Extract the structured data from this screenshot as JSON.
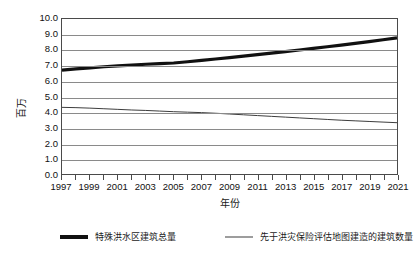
{
  "chart_data": {
    "type": "line",
    "title": "",
    "xlabel": "年份",
    "ylabel": "百万",
    "xlim": [
      1997,
      2021
    ],
    "ylim": [
      0.0,
      10.0
    ],
    "grid": true,
    "legend_position": "bottom",
    "x": [
      1997,
      1998,
      1999,
      2000,
      2001,
      2002,
      2003,
      2004,
      2005,
      2006,
      2007,
      2008,
      2009,
      2010,
      2011,
      2012,
      2013,
      2014,
      2015,
      2016,
      2017,
      2018,
      2019,
      2020,
      2021
    ],
    "x_tick_labels": [
      "1997",
      "1999",
      "2001",
      "2003",
      "2005",
      "2007",
      "2009",
      "2011",
      "2013",
      "2015",
      "2017",
      "2019",
      "2021"
    ],
    "y_tick_labels": [
      "10.0",
      "9.0",
      "8.0",
      "7.0",
      "6.0",
      "5.0",
      "4.0",
      "3.0",
      "2.0",
      "1.0",
      "0.0"
    ],
    "y_ticks": [
      10.0,
      9.0,
      8.0,
      7.0,
      6.0,
      5.0,
      4.0,
      3.0,
      2.0,
      1.0,
      0.0
    ],
    "series": [
      {
        "name": "特殊洪水区建筑总量",
        "style": "thick",
        "color": "#111111",
        "values": [
          6.7,
          6.78,
          6.85,
          6.92,
          6.98,
          7.03,
          7.08,
          7.12,
          7.16,
          7.24,
          7.33,
          7.42,
          7.51,
          7.6,
          7.7,
          7.8,
          7.9,
          8.0,
          8.1,
          8.21,
          8.32,
          8.43,
          8.54,
          8.66,
          8.78
        ]
      },
      {
        "name": "先于洪灾保险评估地图建造的建筑数量",
        "style": "thin",
        "color": "#3d3d3d",
        "values": [
          4.3,
          4.28,
          4.25,
          4.21,
          4.17,
          4.13,
          4.1,
          4.06,
          4.02,
          3.99,
          3.96,
          3.92,
          3.87,
          3.82,
          3.77,
          3.72,
          3.67,
          3.62,
          3.57,
          3.52,
          3.47,
          3.43,
          3.39,
          3.35,
          3.31
        ]
      }
    ]
  },
  "legend": {
    "entries": [
      {
        "label": "特殊洪水区建筑总量"
      },
      {
        "label": "先于洪灾保险评估地图建造的建筑数量"
      }
    ]
  }
}
